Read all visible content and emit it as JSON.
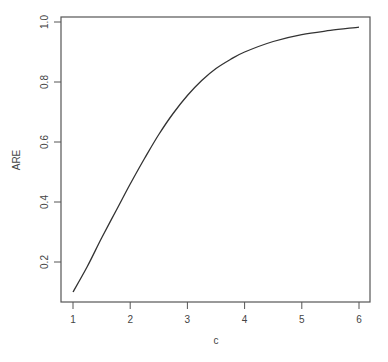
{
  "chart_data": {
    "type": "line",
    "title": "",
    "xlabel": "c",
    "ylabel": "ARE",
    "xlim": [
      0.92,
      6.2
    ],
    "ylim": [
      0.07,
      1.017
    ],
    "grid": false,
    "legend": null,
    "x_ticks": [
      1,
      2,
      3,
      4,
      5,
      6
    ],
    "x_tick_labels": [
      "1",
      "2",
      "3",
      "4",
      "5",
      "6"
    ],
    "y_ticks": [
      0.2,
      0.4,
      0.6,
      0.8,
      1.0
    ],
    "y_tick_labels": [
      "0.2",
      "0.4",
      "0.6",
      "0.8",
      "1.0"
    ],
    "series": [
      {
        "name": "ARE",
        "color": "#333333",
        "x": [
          1.0,
          1.25,
          1.5,
          1.75,
          2.0,
          2.25,
          2.5,
          2.75,
          3.0,
          3.25,
          3.5,
          3.75,
          4.0,
          4.5,
          5.0,
          5.5,
          6.0
        ],
        "values": [
          0.1,
          0.185,
          0.28,
          0.37,
          0.46,
          0.545,
          0.625,
          0.695,
          0.755,
          0.805,
          0.845,
          0.875,
          0.9,
          0.935,
          0.958,
          0.972,
          0.983
        ]
      }
    ]
  }
}
